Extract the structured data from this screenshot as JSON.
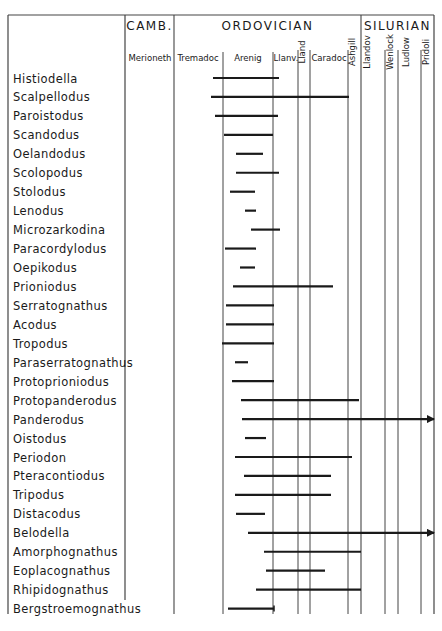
{
  "chart_data": {
    "type": "range-bar (stratigraphic range chart)",
    "title": "",
    "periods": [
      {
        "label": "CAMB.",
        "x0": 125,
        "x1": 174
      },
      {
        "label": "ORDOVICIAN",
        "x0": 174,
        "x1": 361
      },
      {
        "label": "SILURIAN",
        "x0": 361,
        "x1": 434
      }
    ],
    "stages": [
      {
        "label": "Merioneth",
        "x0": 125,
        "x1": 174,
        "vertical": false,
        "label_x": 150
      },
      {
        "label": "Tremadoc",
        "x0": 174,
        "x1": 223,
        "vertical": false,
        "label_x": 198
      },
      {
        "label": "Arenig",
        "x0": 223,
        "x1": 273,
        "vertical": false,
        "label_x": 248
      },
      {
        "label": "Llanv.",
        "x0": 273,
        "x1": 298,
        "vertical": false,
        "label_x": 286
      },
      {
        "label": "Lland",
        "x0": 298,
        "x1": 310,
        "vertical": true,
        "label_x": 305
      },
      {
        "label": "Caradoc",
        "x0": 310,
        "x1": 348,
        "vertical": false,
        "label_x": 329
      },
      {
        "label": "Ashgill",
        "x0": 348,
        "x1": 361,
        "vertical": true,
        "label_x": 355
      },
      {
        "label": "Llandov",
        "x0": 361,
        "x1": 385,
        "vertical": true,
        "label_x": 370
      },
      {
        "label": "Wenlock",
        "x0": 385,
        "x1": 398,
        "vertical": true,
        "label_x": 393
      },
      {
        "label": "Ludlow",
        "x0": 398,
        "x1": 421,
        "vertical": true,
        "label_x": 409
      },
      {
        "label": "Pridoli",
        "x0": 421,
        "x1": 434,
        "vertical": true,
        "label_x": 429
      }
    ],
    "series": [
      {
        "name": "Histiodella",
        "start": 213,
        "end": 279,
        "arrow": false
      },
      {
        "name": "Scalpellodus",
        "start": 211,
        "end": 349,
        "arrow": false
      },
      {
        "name": "Paroistodus",
        "start": 215,
        "end": 278,
        "arrow": false
      },
      {
        "name": "Scandodus",
        "start": 224,
        "end": 273,
        "arrow": false
      },
      {
        "name": "Oelandodus",
        "start": 236,
        "end": 263,
        "arrow": false
      },
      {
        "name": "Scolopodus",
        "start": 236,
        "end": 279,
        "arrow": false
      },
      {
        "name": "Stolodus",
        "start": 230,
        "end": 255,
        "arrow": false
      },
      {
        "name": "Lenodus",
        "start": 245,
        "end": 256,
        "arrow": false
      },
      {
        "name": "Microzarkodina",
        "start": 251,
        "end": 280,
        "arrow": false
      },
      {
        "name": "Paracordylodus",
        "start": 225,
        "end": 256,
        "arrow": false
      },
      {
        "name": "Oepikodus",
        "start": 240,
        "end": 255,
        "arrow": false
      },
      {
        "name": "Prioniodus",
        "start": 233,
        "end": 333,
        "arrow": false
      },
      {
        "name": "Serratognathus",
        "start": 226,
        "end": 274,
        "arrow": false
      },
      {
        "name": "Acodus",
        "start": 226,
        "end": 274,
        "arrow": false
      },
      {
        "name": "Tropodus",
        "start": 222,
        "end": 274,
        "arrow": false
      },
      {
        "name": "Paraserratognathus",
        "start": 235,
        "end": 248,
        "arrow": false
      },
      {
        "name": "Protoprioniodus",
        "start": 232,
        "end": 274,
        "arrow": false
      },
      {
        "name": "Protopanderodus",
        "start": 241,
        "end": 359,
        "arrow": false
      },
      {
        "name": "Panderodus",
        "start": 242,
        "end": 436,
        "arrow": true
      },
      {
        "name": "Oistodus",
        "start": 245,
        "end": 266,
        "arrow": false
      },
      {
        "name": "Periodon",
        "start": 235,
        "end": 352,
        "arrow": false
      },
      {
        "name": "Pteracontiodus",
        "start": 244,
        "end": 331,
        "arrow": false
      },
      {
        "name": "Tripodus",
        "start": 235,
        "end": 331,
        "arrow": false
      },
      {
        "name": "Distacodus",
        "start": 236,
        "end": 265,
        "arrow": false
      },
      {
        "name": "Belodella",
        "start": 248,
        "end": 436,
        "arrow": true
      },
      {
        "name": "Amorphognathus",
        "start": 264,
        "end": 361,
        "arrow": false
      },
      {
        "name": "Eoplacognathus",
        "start": 266,
        "end": 325,
        "arrow": false
      },
      {
        "name": "Rhipidognathus",
        "start": 256,
        "end": 361,
        "arrow": false
      },
      {
        "name": "Bergstroemognathus",
        "start": 228,
        "end": 274,
        "arrow": false,
        "end_tick": true
      }
    ],
    "range_units": "pixel x-position in chart (stage boundaries given in 'stages')",
    "grid": "vertical stage boundary lines",
    "legend": "none"
  },
  "layout": {
    "frame_left": 8,
    "frame_right": 434,
    "frame_top": 15,
    "frame_bottom": 614,
    "header_divider_y": 34,
    "name_col_right": 125,
    "first_row_y": 78,
    "row_height": 18.95
  },
  "colors": {
    "ink": "#1a1a1a",
    "grid": "#444444",
    "background": "#ffffff"
  }
}
